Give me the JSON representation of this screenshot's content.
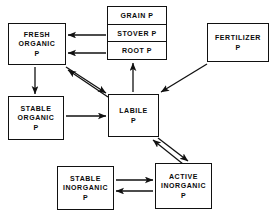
{
  "diagram": {
    "stroke_color": "#111111",
    "background_color": "#ffffff",
    "nodes": [
      {
        "id": "fresh_organic",
        "lines": [
          "FRESH",
          "ORGANIC",
          "P"
        ],
        "x": 8,
        "y": 23,
        "w": 58,
        "h": 42
      },
      {
        "id": "stable_organic",
        "lines": [
          "STABLE",
          "ORGANIC",
          "P"
        ],
        "x": 8,
        "y": 96,
        "w": 56,
        "h": 44
      },
      {
        "id": "labile",
        "lines": [
          "LABILE",
          "P"
        ],
        "x": 108,
        "y": 94,
        "w": 51,
        "h": 43
      },
      {
        "id": "fertilizer",
        "lines": [
          "FERTILIZER",
          "P"
        ],
        "x": 207,
        "y": 23,
        "w": 62,
        "h": 39
      },
      {
        "id": "stable_inorganic",
        "lines": [
          "STABLE",
          "INORGANIC",
          "P"
        ],
        "x": 57,
        "y": 166,
        "w": 57,
        "h": 44
      },
      {
        "id": "active_inorganic",
        "lines": [
          "ACTIVE",
          "INORGANIC",
          "P"
        ],
        "x": 155,
        "y": 163,
        "w": 57,
        "h": 46
      }
    ],
    "stack": {
      "id": "crop_fractions",
      "x": 107,
      "y": 6,
      "w": 60,
      "h": 54,
      "cells": [
        "GRAIN  P",
        "STOVER  P",
        "ROOT  P"
      ]
    },
    "arrows": [
      {
        "id": "stover-to-fresh",
        "from": "stover_p",
        "to": "fresh_organic",
        "style": "single",
        "direction": "left"
      },
      {
        "id": "root-to-fresh",
        "from": "root_p",
        "to": "fresh_organic",
        "style": "single",
        "direction": "left"
      },
      {
        "id": "fresh-to-stable-organic",
        "from": "fresh_organic",
        "to": "stable_organic",
        "style": "single",
        "direction": "down"
      },
      {
        "id": "fresh-labile-exchange",
        "from": "fresh_organic",
        "to": "labile",
        "style": "double-diagonal",
        "direction": "bidirectional"
      },
      {
        "id": "stable-organic-to-labile",
        "from": "stable_organic",
        "to": "labile",
        "style": "single",
        "direction": "right"
      },
      {
        "id": "labile-to-root",
        "from": "labile",
        "to": "root_p",
        "style": "single",
        "direction": "up"
      },
      {
        "id": "fertilizer-to-labile",
        "from": "fertilizer",
        "to": "labile",
        "style": "single",
        "direction": "down-left"
      },
      {
        "id": "labile-active-exchange",
        "from": "labile",
        "to": "active_inorganic",
        "style": "double-diagonal",
        "direction": "bidirectional"
      },
      {
        "id": "stable-to-active-inorganic",
        "from": "stable_inorganic",
        "to": "active_inorganic",
        "style": "single",
        "direction": "right"
      },
      {
        "id": "active-to-stable-inorganic",
        "from": "active_inorganic",
        "to": "stable_inorganic",
        "style": "single",
        "direction": "left"
      }
    ]
  }
}
